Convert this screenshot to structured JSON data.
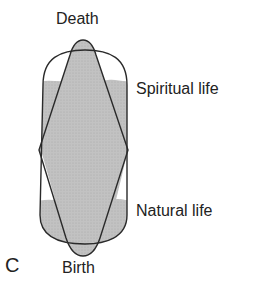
{
  "diagram": {
    "panel_letter": "C",
    "labels": {
      "top": "Death",
      "upper_right": "Spiritual life",
      "lower_right": "Natural life",
      "bottom": "Birth"
    },
    "colors": {
      "outline": "#2a2a2a",
      "shading": "#bdbdbd",
      "background": "#ffffff"
    }
  }
}
